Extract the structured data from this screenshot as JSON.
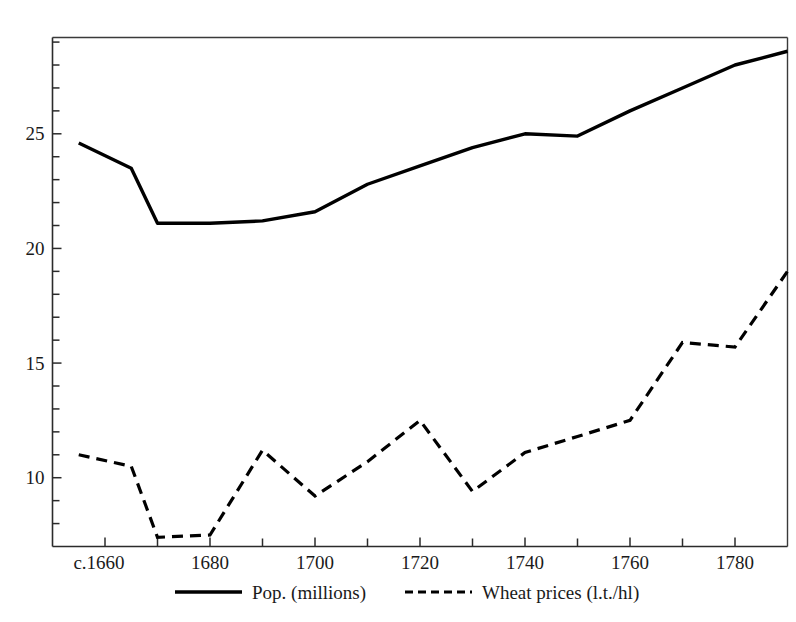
{
  "chart_data": {
    "type": "line",
    "title": "",
    "subtitle": "",
    "xlabel": "",
    "ylabel": "",
    "xlim": [
      1650,
      1790
    ],
    "ylim": [
      7,
      29.2
    ],
    "grid": false,
    "legend_position": "bottom",
    "x_tick_labels": [
      "c.1660",
      "1680",
      "1700",
      "1720",
      "1740",
      "1760",
      "1780"
    ],
    "x_tick_values": [
      1660,
      1680,
      1700,
      1720,
      1740,
      1760,
      1780
    ],
    "x_minor_tick_values": [
      1650,
      1670,
      1690,
      1710,
      1730,
      1750,
      1770,
      1790
    ],
    "y_tick_labels": [
      "25",
      "20",
      "15",
      "10"
    ],
    "y_tick_values": [
      25,
      20,
      15,
      10
    ],
    "y_minor_tick_values": [
      8,
      9,
      11,
      12,
      13,
      14,
      16,
      17,
      18,
      19,
      21,
      22,
      23,
      24,
      26,
      27,
      28,
      29
    ],
    "x": [
      1655,
      1665,
      1670,
      1680,
      1690,
      1700,
      1710,
      1720,
      1730,
      1740,
      1750,
      1760,
      1770,
      1780,
      1790
    ],
    "series": [
      {
        "name": "Pop. (millions)",
        "style": "solid",
        "color": "#000000",
        "values": [
          24.6,
          23.5,
          21.1,
          21.1,
          21.2,
          21.6,
          22.8,
          23.6,
          24.4,
          25.0,
          24.9,
          26.0,
          27.0,
          28.0,
          28.6
        ]
      },
      {
        "name": "Wheat prices (l.t./hl)",
        "style": "dashed",
        "color": "#000000",
        "values": [
          11.0,
          10.5,
          7.4,
          7.5,
          11.2,
          9.2,
          10.7,
          12.5,
          9.4,
          11.1,
          11.8,
          12.5,
          15.9,
          15.7,
          19.0
        ]
      }
    ]
  },
  "legend": {
    "entries": [
      {
        "label": "Pop. (millions)",
        "style": "solid"
      },
      {
        "label": "Wheat prices (l.t./hl)",
        "style": "dashed"
      }
    ]
  }
}
